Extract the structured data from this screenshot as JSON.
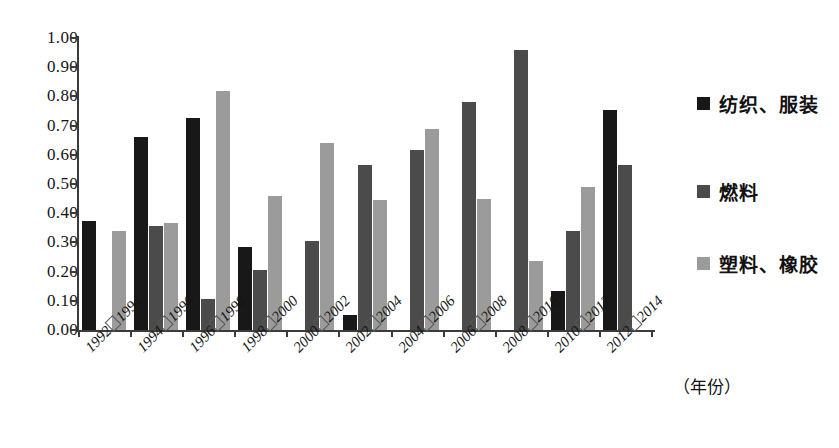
{
  "chart_data": {
    "type": "bar",
    "title": "",
    "subtitle": "",
    "xlabel": "（年份）",
    "ylabel": "",
    "ylim": [
      0.0,
      1.0
    ],
    "ytick_labels": [
      "1.00",
      "0.90",
      "0.80",
      "0.70",
      "0.60",
      "0.50",
      "0.40",
      "0.30",
      "0.20",
      "0.10",
      "0.00"
    ],
    "ytick_values": [
      1.0,
      0.9,
      0.8,
      0.7,
      0.6,
      0.5,
      0.4,
      0.3,
      0.2,
      0.1,
      0.0
    ],
    "grid": false,
    "legend_position": "right",
    "categories": [
      "1992□1994",
      "1994□1996",
      "1996□1998",
      "1998□2000",
      "2000□2002",
      "2002□2004",
      "2004□2006",
      "2006□2008",
      "2008□2010",
      "2010□2012",
      "2012□2014"
    ],
    "category_parts": [
      {
        "start": "1992",
        "end": "1994"
      },
      {
        "start": "1994",
        "end": "1996"
      },
      {
        "start": "1996",
        "end": "1998"
      },
      {
        "start": "1998",
        "end": "2000"
      },
      {
        "start": "2000",
        "end": "2002"
      },
      {
        "start": "2002",
        "end": "2004"
      },
      {
        "start": "2004",
        "end": "2006"
      },
      {
        "start": "2006",
        "end": "2008"
      },
      {
        "start": "2008",
        "end": "2010"
      },
      {
        "start": "2010",
        "end": "2012"
      },
      {
        "start": "2012",
        "end": "2014"
      }
    ],
    "series": [
      {
        "name": "纺织、服装",
        "color": "#181818",
        "values": [
          0.375,
          0.66,
          0.725,
          0.285,
          0.0,
          0.05,
          0.0,
          0.0,
          0.0,
          0.135,
          0.755
        ]
      },
      {
        "name": "燃料",
        "color": "#4b4b4b",
        "values": [
          0.0,
          0.355,
          0.105,
          0.205,
          0.305,
          0.565,
          0.615,
          0.78,
          0.96,
          0.34,
          0.565
        ]
      },
      {
        "name": "塑料、橡胶",
        "color": "#9b9b9b",
        "values": [
          0.34,
          0.365,
          0.82,
          0.46,
          0.64,
          0.445,
          0.69,
          0.45,
          0.235,
          0.49,
          0.0
        ]
      }
    ]
  },
  "legend": {
    "items": [
      {
        "label": "纺织、服装",
        "color": "#181818"
      },
      {
        "label": "燃料",
        "color": "#4b4b4b"
      },
      {
        "label": "塑料、橡胶",
        "color": "#9b9b9b"
      }
    ]
  },
  "axes": {
    "x_axis_title": "（年份）"
  }
}
